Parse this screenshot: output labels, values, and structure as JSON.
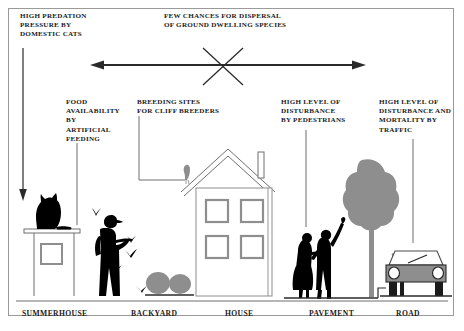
{
  "pressure_labels": {
    "predation": "HIGH PREDATION\nPRESSURE  BY\nDOMESTIC  CATS",
    "dispersal": "FEW CHANCES FOR DISPERSAL\nOF GROUND DWELLING SPECIES",
    "food": "FOOD\nAVAILABILITY\nBY\nARTIFICIAL\nFEEDING",
    "breeding": "BREEDING SITES\nFOR CLIFF BREEDERS",
    "pedestrians": "HIGH LEVEL OF\nDISTURBANCE\nBY PEDESTRIANS",
    "traffic": "HIGH LEVEL OF\nDISTURBANCE AND\nMORTALITY BY\nTRAFFIC"
  },
  "zones": [
    {
      "id": "summerhouse",
      "label": "SUMMERHOUSE"
    },
    {
      "id": "backyard",
      "label": "BACKYARD"
    },
    {
      "id": "house",
      "label": "HOUSE"
    },
    {
      "id": "pavement",
      "label": "PAVEMENT"
    },
    {
      "id": "road",
      "label": "ROAD"
    }
  ],
  "icons": {
    "cat": "cat-silhouette-icon",
    "person_feeding": "person-feeding-birds-icon",
    "birds": "flying-birds-icon",
    "bushes": "bushes-icon",
    "house": "house-icon",
    "roof_bird": "perched-bird-icon",
    "pedestrians": "pedestrians-icon",
    "tree": "tree-icon",
    "street_lamp": "street-lamp-icon",
    "car": "car-front-icon",
    "dispersal_arrow": "double-headed-arrow-icon",
    "blocked_cross": "cross-out-x-icon",
    "down_arrow": "down-arrow-icon"
  },
  "colors": {
    "ink": "#1b1b1b",
    "line": "#6f6f6f",
    "gray_fill": "#8e8e8e",
    "silhouette": "#000000",
    "frame": "#9a9a9a"
  }
}
